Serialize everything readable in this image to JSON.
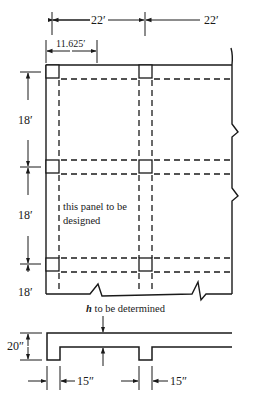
{
  "diagram": {
    "type": "structural floor plan and beam section",
    "plan": {
      "top_dimensions": [
        "22′",
        "22′"
      ],
      "sub_dimension": "11.625′",
      "left_dimensions": [
        "18′",
        "18′",
        "18′"
      ],
      "panel_label_line1": "this panel to be",
      "panel_label_line2": "designed"
    },
    "section": {
      "caption": "h to be determined",
      "caption_italic": "h",
      "caption_rest": " to be determined",
      "depth_dimension": "20″",
      "web_widths": [
        "15″",
        "15″"
      ]
    },
    "colors": {
      "line": "#1a1a1a",
      "background": "#ffffff"
    }
  }
}
